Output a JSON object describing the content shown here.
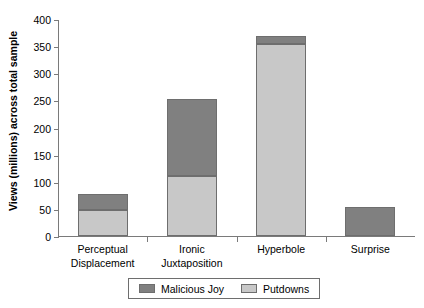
{
  "chart_data": {
    "type": "bar",
    "subtype": "stacked-bar",
    "title": "",
    "xlabel": "",
    "ylabel": "Views (millions) across total sample",
    "categories": [
      "Perceptual Displacement",
      "Ironic Juxtaposition",
      "Hyperbole",
      "Surprise"
    ],
    "category_lines": [
      [
        "Perceptual",
        "Displacement"
      ],
      [
        "Ironic",
        "Juxtaposition"
      ],
      [
        "Hyperbole"
      ],
      [
        "Surprise"
      ]
    ],
    "series": [
      {
        "name": "Putdowns",
        "color": "#c8c8c8",
        "values": [
          48,
          110,
          354,
          0
        ]
      },
      {
        "name": "Malicious Joy",
        "color": "#808080",
        "values": [
          29,
          143,
          14,
          54
        ]
      }
    ],
    "stack_order": [
      "Putdowns",
      "Malicious Joy"
    ],
    "totals": [
      77,
      253,
      368,
      54
    ],
    "ylim": [
      0,
      400
    ],
    "yticks": [
      0,
      50,
      100,
      150,
      200,
      250,
      300,
      350,
      400
    ],
    "ytick_labels": [
      "0",
      "50",
      "100",
      "150",
      "200",
      "250",
      "300",
      "350",
      "400"
    ],
    "grid": false,
    "legend_position": "bottom",
    "legend_entries": [
      "Malicious Joy",
      "Putdowns"
    ],
    "axis_color": "#7a7a7a",
    "bar_border_color": "#6e6e6e",
    "background": "#ffffff"
  }
}
